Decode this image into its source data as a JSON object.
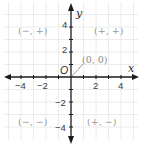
{
  "diagram": {
    "type": "coordinate-plane",
    "x_axis": {
      "label": "x",
      "tick_labels": [
        "−4",
        "−2",
        "2",
        "4"
      ],
      "range": [
        -5,
        5
      ]
    },
    "y_axis": {
      "label": "y",
      "tick_labels": [
        "4",
        "2",
        "−2",
        "−4"
      ],
      "range": [
        -5,
        5
      ]
    },
    "origin_label": "O",
    "origin_callout": "(0, 0)",
    "quadrants": {
      "q1": "(+, +)",
      "q2": "(−, +)",
      "q3": "(−, −)",
      "q4": "(+, −)"
    },
    "colors": {
      "grid": "#ebebeb",
      "axis": "#1a1a1a",
      "quadrant_text": "#9a9a9a",
      "callout_line": "#9a9a9a"
    }
  }
}
